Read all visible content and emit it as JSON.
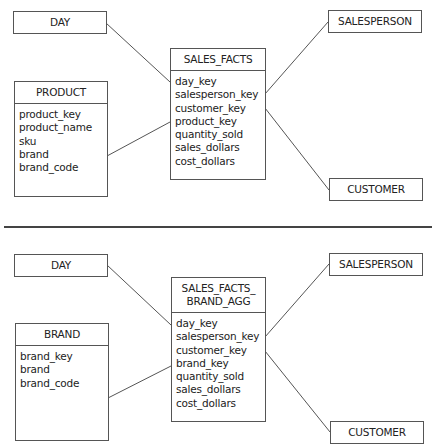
{
  "top_schema": {
    "day": {
      "title": "DAY"
    },
    "salesperson": {
      "title": "SALESPERSON"
    },
    "customer": {
      "title": "CUSTOMER"
    },
    "product": {
      "title": "PRODUCT",
      "fields": [
        "product_key",
        "product_name",
        "sku",
        "brand",
        "brand_code"
      ]
    },
    "fact": {
      "title": "SALES_FACTS",
      "fields": [
        "day_key",
        "salesperson_key",
        "customer_key",
        "product_key",
        "quantity_sold",
        "sales_dollars",
        "cost_dollars"
      ]
    }
  },
  "bottom_schema": {
    "day": {
      "title": "DAY"
    },
    "salesperson": {
      "title": "SALESPERSON"
    },
    "customer": {
      "title": "CUSTOMER"
    },
    "brand": {
      "title": "BRAND",
      "fields": [
        "brand_key",
        "brand",
        "brand_code"
      ]
    },
    "fact": {
      "title_line1": "SALES_FACTS_",
      "title_line2": "BRAND_AGG",
      "fields": [
        "day_key",
        "salesperson_key",
        "customer_key",
        "brand_key",
        "quantity_sold",
        "sales_dollars",
        "cost_dollars"
      ]
    }
  }
}
